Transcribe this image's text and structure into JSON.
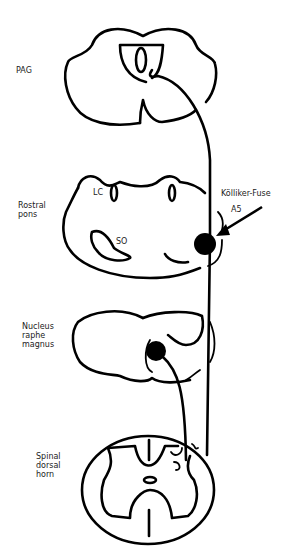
{
  "figure": {
    "type": "neuroanatomy schematic",
    "labels": {
      "pag": "PAG",
      "rostral_pons": "Rostral\npons",
      "lc": "LC",
      "so": "SO",
      "kolliker_fuse": "Kölliker-Fuse",
      "a5": "A5",
      "nrm": "Nucleus\nraphe\nmagnus",
      "spinal": "Spinal\ndorsal\nhorn"
    },
    "sections": [
      "PAG",
      "Rostral pons",
      "Nucleus raphe magnus",
      "Spinal dorsal horn"
    ],
    "colors": {
      "ink": "#000000",
      "background": "#ffffff"
    }
  }
}
